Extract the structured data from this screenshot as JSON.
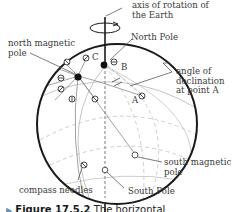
{
  "diagram": {
    "labels": {
      "axis": "axis of rotation of\nthe Earth",
      "axis_line1": "axis of rotation of",
      "axis_line2": "the Earth",
      "north_pole": "North Pole",
      "north_magnetic_line1": "north magnetic",
      "north_magnetic_line2": "pole",
      "angle_line1": "angle of",
      "angle_line2": "declination",
      "angle_line3": "at point A",
      "point_a": "A",
      "point_b": "B",
      "point_c": "C",
      "south_magnetic_line1": "south magnetic",
      "south_magnetic_line2": "pole",
      "compass_needles": "compass needles",
      "south_pole": "South Pole"
    },
    "caption": {
      "arrow": "▶",
      "figure": "Figure 17.5.2",
      "text": "The horizontal"
    },
    "colors": {
      "outline": "#1a1a1a",
      "grid": "#b0b0b0",
      "field_lines": "#909090",
      "text": "#3a3a3a"
    }
  }
}
